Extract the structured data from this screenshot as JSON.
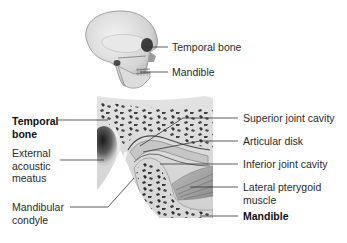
{
  "figure": {
    "skull_view": {
      "labels": [
        {
          "id": "temporal-bone",
          "text": "Temporal bone",
          "bold": false
        },
        {
          "id": "mandible",
          "text": "Mandible",
          "bold": false
        }
      ]
    },
    "joint_section": {
      "left_labels": [
        {
          "id": "temporal-bone",
          "line1": "Temporal",
          "line2": "bone",
          "bold": true
        },
        {
          "id": "external-acoustic-meatus",
          "line1": "External",
          "line2": "acoustic",
          "line3": "meatus",
          "bold": false
        },
        {
          "id": "mandibular-condyle",
          "line1": "Mandibular",
          "line2": "condyle",
          "bold": false
        }
      ],
      "right_labels": [
        {
          "id": "superior-joint-cavity",
          "text": "Superior joint cavity",
          "bold": false
        },
        {
          "id": "articular-disk",
          "text": "Articular disk",
          "bold": false
        },
        {
          "id": "inferior-joint-cavity",
          "text": "Inferior joint cavity",
          "bold": false
        },
        {
          "id": "lateral-pterygoid-muscle",
          "line1": "Lateral pterygoid",
          "line2": "muscle",
          "bold": false
        },
        {
          "id": "mandible",
          "text": "Mandible",
          "bold": true
        }
      ]
    },
    "colors": {
      "bone_fill": "#d9d9d9",
      "bone_edge": "#a8a8a8",
      "trabecula": "#3a3a3a",
      "cavity_dark": "#2a2a2a",
      "disk": "#c4c4c4",
      "muscle": "#9a9a9a",
      "leader_line": "#333333"
    }
  }
}
